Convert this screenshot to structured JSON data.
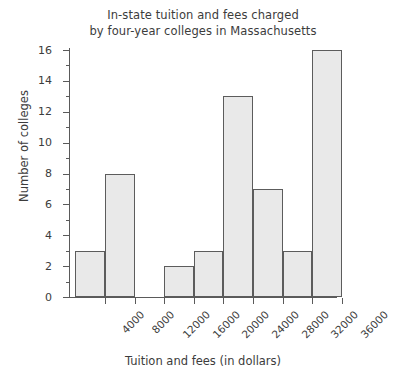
{
  "chart_data": {
    "type": "bar",
    "title": "In-state tuition and fees charged by four-year colleges in Massachusetts",
    "title_lines": [
      "In-state tuition and fees charged",
      "by four-year colleges in Massachusetts"
    ],
    "xlabel": "Tuition and fees (in dollars)",
    "ylabel": "Number of colleges",
    "categories": [
      "0-4000",
      "4000-8000",
      "8000-12000",
      "12000-16000",
      "16000-20000",
      "20000-24000",
      "24000-28000",
      "28000-32000",
      "32000-36000"
    ],
    "values": [
      3,
      8,
      0,
      2,
      3,
      13,
      7,
      3,
      16
    ],
    "bin_edges": [
      0,
      4000,
      8000,
      12000,
      16000,
      20000,
      24000,
      28000,
      32000,
      36000
    ],
    "x_tick_labels": [
      "4000",
      "8000",
      "12000",
      "16000",
      "20000",
      "24000",
      "28000",
      "32000",
      "36000"
    ],
    "x_tick_values": [
      4000,
      8000,
      12000,
      16000,
      20000,
      24000,
      28000,
      32000,
      36000
    ],
    "y_tick_labels": [
      "0",
      "2",
      "4",
      "6",
      "8",
      "10",
      "12",
      "14",
      "16"
    ],
    "y_tick_values": [
      0,
      2,
      4,
      6,
      8,
      10,
      12,
      14,
      16
    ],
    "y_minor_tick_values": [
      1,
      3,
      5,
      7,
      9,
      11,
      13,
      15
    ],
    "ylim": [
      0,
      16
    ],
    "xlim": [
      0,
      36000
    ],
    "grid": false,
    "legend": false,
    "bar_fill_color": "#e9e9e9",
    "bar_border_color": "#5c5c5c",
    "axis_color": "#5a5a5a",
    "background_color": "#ffffff"
  }
}
